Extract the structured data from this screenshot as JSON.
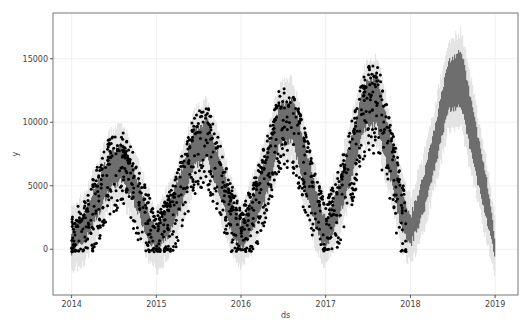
{
  "chart_data": {
    "type": "line",
    "title": "",
    "xlabel": "ds",
    "ylabel": "y",
    "xlim": [
      2013.78,
      2019.27
    ],
    "ylim": [
      -3600,
      18600
    ],
    "grid": true,
    "legend": null,
    "x_ticks": [
      2014,
      2015,
      2016,
      2017,
      2018,
      2019
    ],
    "x_tick_labels": [
      "2014",
      "2015",
      "2016",
      "2017",
      "2018",
      "2019"
    ],
    "y_ticks": [
      0,
      5000,
      10000,
      15000
    ],
    "y_tick_labels": [
      "0",
      "5000",
      "10000",
      "15000"
    ],
    "colors": {
      "forecast": "#6b6b6b",
      "uncertainty": "#dcdcdc",
      "observed": "#000000",
      "axes": "#555555",
      "grid": "#f0f0f0"
    },
    "series": [
      {
        "name": "yhat (forecast)",
        "kind": "band",
        "x": [
          2014.0,
          2014.15,
          2014.3,
          2014.45,
          2014.6,
          2014.75,
          2014.9,
          2015.0,
          2015.15,
          2015.3,
          2015.45,
          2015.6,
          2015.75,
          2015.9,
          2016.0,
          2016.15,
          2016.3,
          2016.45,
          2016.6,
          2016.75,
          2016.9,
          2017.0,
          2017.15,
          2017.3,
          2017.45,
          2017.6,
          2017.75,
          2017.9,
          2018.0,
          2018.15,
          2018.3,
          2018.45,
          2018.6,
          2018.75,
          2018.9,
          2019.0
        ],
        "lower": [
          -200,
          600,
          2500,
          4800,
          5400,
          3500,
          900,
          -200,
          1100,
          3400,
          6500,
          7200,
          4300,
          1000,
          0,
          1600,
          4200,
          8200,
          8600,
          5000,
          1300,
          200,
          2400,
          5400,
          9500,
          9800,
          6000,
          1500,
          300,
          2800,
          6800,
          11000,
          11200,
          6600,
          2200,
          -600
        ],
        "upper": [
          1500,
          2800,
          5200,
          7600,
          8200,
          6000,
          3200,
          1500,
          3400,
          6200,
          9300,
          10200,
          7200,
          3600,
          2000,
          4200,
          7400,
          11300,
          11900,
          8400,
          4200,
          2300,
          5000,
          8600,
          12800,
          13800,
          9400,
          4400,
          2500,
          5600,
          10000,
          14800,
          15600,
          10600,
          5400,
          700
        ]
      },
      {
        "name": "y (observed)",
        "kind": "scatter",
        "x_range": [
          2014.0,
          2017.95
        ],
        "approx_peaks": [
          {
            "x": 2014.6,
            "y": 9800
          },
          {
            "x": 2015.6,
            "y": 12900
          },
          {
            "x": 2016.55,
            "y": 14000
          },
          {
            "x": 2017.6,
            "y": 16200
          }
        ],
        "approx_troughs": [
          {
            "x": 2014.0,
            "y": 0
          },
          {
            "x": 2015.05,
            "y": 100
          },
          {
            "x": 2016.05,
            "y": 600
          },
          {
            "x": 2017.05,
            "y": 600
          },
          {
            "x": 2017.95,
            "y": 1400
          }
        ]
      }
    ]
  }
}
